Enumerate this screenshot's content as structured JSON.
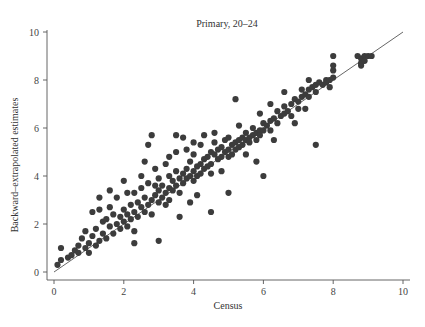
{
  "chart_data": {
    "type": "scatter",
    "title": "Primary, 20–24",
    "xlabel": "Census",
    "ylabel": "Backward–extrapolated estimates",
    "xlim": [
      0,
      10
    ],
    "ylim": [
      0,
      10
    ],
    "xticks": [
      "0",
      "2",
      "4",
      "6",
      "8",
      "10"
    ],
    "yticks": [
      "0",
      "2",
      "4",
      "6",
      "8",
      "10"
    ],
    "grid": false,
    "legend": null,
    "reference_line": {
      "type": "45-degree",
      "from": [
        0,
        0
      ],
      "to": [
        10,
        10
      ]
    },
    "marker_color": "#3c3c3c",
    "line_color": "#555555",
    "points": [
      [
        0.1,
        0.3
      ],
      [
        0.2,
        0.5
      ],
      [
        0.2,
        1.0
      ],
      [
        0.4,
        0.6
      ],
      [
        0.5,
        0.7
      ],
      [
        0.6,
        0.9
      ],
      [
        0.7,
        0.8
      ],
      [
        0.7,
        1.1
      ],
      [
        0.8,
        1.4
      ],
      [
        0.9,
        1.0
      ],
      [
        1.0,
        1.2
      ],
      [
        1.0,
        0.8
      ],
      [
        1.1,
        1.5
      ],
      [
        1.2,
        1.1
      ],
      [
        1.2,
        1.8
      ],
      [
        1.3,
        1.3
      ],
      [
        1.3,
        2.6
      ],
      [
        1.4,
        1.6
      ],
      [
        1.4,
        2.1
      ],
      [
        1.5,
        1.4
      ],
      [
        1.5,
        2.2
      ],
      [
        1.6,
        1.9
      ],
      [
        1.6,
        2.7
      ],
      [
        1.7,
        1.6
      ],
      [
        1.7,
        2.4
      ],
      [
        1.8,
        2.0
      ],
      [
        1.8,
        3.1
      ],
      [
        1.9,
        2.3
      ],
      [
        1.9,
        1.8
      ],
      [
        2.0,
        2.1
      ],
      [
        2.0,
        2.6
      ],
      [
        2.0,
        3.8
      ],
      [
        2.1,
        2.4
      ],
      [
        2.1,
        1.9
      ],
      [
        2.2,
        2.8
      ],
      [
        2.2,
        2.2
      ],
      [
        2.3,
        2.5
      ],
      [
        2.3,
        3.3
      ],
      [
        2.3,
        1.7
      ],
      [
        2.4,
        2.9
      ],
      [
        2.4,
        2.3
      ],
      [
        2.5,
        2.7
      ],
      [
        2.5,
        3.5
      ],
      [
        2.5,
        4.0
      ],
      [
        2.6,
        2.5
      ],
      [
        2.6,
        3.1
      ],
      [
        2.7,
        2.8
      ],
      [
        2.7,
        3.7
      ],
      [
        2.8,
        3.0
      ],
      [
        2.8,
        2.4
      ],
      [
        2.9,
        3.2
      ],
      [
        2.9,
        4.3
      ],
      [
        3.0,
        3.4
      ],
      [
        3.0,
        2.9
      ],
      [
        3.0,
        3.9
      ],
      [
        3.1,
        3.1
      ],
      [
        3.1,
        3.6
      ],
      [
        3.2,
        3.3
      ],
      [
        3.2,
        4.5
      ],
      [
        3.3,
        3.5
      ],
      [
        3.3,
        3.0
      ],
      [
        3.3,
        4.0
      ],
      [
        3.4,
        3.8
      ],
      [
        3.4,
        3.4
      ],
      [
        3.5,
        3.6
      ],
      [
        3.5,
        4.2
      ],
      [
        3.5,
        5.0
      ],
      [
        3.6,
        3.9
      ],
      [
        3.6,
        3.3
      ],
      [
        3.7,
        4.1
      ],
      [
        3.7,
        3.7
      ],
      [
        3.8,
        4.3
      ],
      [
        3.8,
        3.9
      ],
      [
        3.8,
        5.1
      ],
      [
        3.9,
        4.0
      ],
      [
        3.9,
        4.6
      ],
      [
        4.0,
        4.2
      ],
      [
        4.0,
        3.8
      ],
      [
        4.0,
        4.9
      ],
      [
        4.1,
        4.4
      ],
      [
        4.1,
        4.0
      ],
      [
        4.2,
        4.5
      ],
      [
        4.2,
        4.1
      ],
      [
        4.2,
        5.3
      ],
      [
        4.3,
        4.7
      ],
      [
        4.3,
        4.3
      ],
      [
        4.4,
        4.8
      ],
      [
        4.4,
        4.4
      ],
      [
        4.5,
        5.0
      ],
      [
        4.5,
        4.5
      ],
      [
        4.5,
        4.1
      ],
      [
        4.6,
        4.9
      ],
      [
        4.6,
        5.4
      ],
      [
        4.7,
        4.7
      ],
      [
        4.7,
        5.1
      ],
      [
        4.8,
        5.2
      ],
      [
        4.8,
        4.8
      ],
      [
        4.9,
        5.0
      ],
      [
        4.9,
        5.5
      ],
      [
        5.0,
        5.1
      ],
      [
        5.0,
        4.8
      ],
      [
        5.0,
        5.6
      ],
      [
        5.1,
        5.3
      ],
      [
        5.1,
        4.9
      ],
      [
        5.2,
        5.4
      ],
      [
        5.2,
        5.1
      ],
      [
        5.3,
        5.5
      ],
      [
        5.3,
        5.2
      ],
      [
        5.4,
        5.6
      ],
      [
        5.4,
        5.3
      ],
      [
        5.5,
        5.5
      ],
      [
        5.5,
        5.8
      ],
      [
        5.6,
        5.6
      ],
      [
        5.6,
        5.4
      ],
      [
        5.7,
        5.7
      ],
      [
        5.7,
        6.0
      ],
      [
        5.8,
        5.8
      ],
      [
        5.8,
        5.5
      ],
      [
        5.9,
        5.9
      ],
      [
        5.9,
        5.7
      ],
      [
        6.0,
        5.9
      ],
      [
        6.0,
        6.2
      ],
      [
        6.1,
        6.1
      ],
      [
        6.2,
        6.3
      ],
      [
        6.2,
        5.9
      ],
      [
        6.3,
        6.4
      ],
      [
        6.4,
        6.2
      ],
      [
        6.4,
        6.7
      ],
      [
        6.5,
        6.5
      ],
      [
        6.6,
        6.6
      ],
      [
        6.6,
        6.9
      ],
      [
        6.7,
        6.7
      ],
      [
        6.8,
        7.0
      ],
      [
        6.8,
        6.5
      ],
      [
        6.9,
        7.2
      ],
      [
        7.0,
        7.1
      ],
      [
        7.0,
        6.8
      ],
      [
        7.1,
        7.3
      ],
      [
        7.1,
        7.6
      ],
      [
        7.2,
        7.4
      ],
      [
        7.3,
        7.6
      ],
      [
        7.3,
        7.3
      ],
      [
        7.4,
        7.7
      ],
      [
        7.5,
        7.8
      ],
      [
        7.5,
        7.5
      ],
      [
        7.6,
        7.9
      ],
      [
        7.7,
        7.8
      ],
      [
        7.8,
        8.0
      ],
      [
        7.8,
        7.9
      ],
      [
        7.9,
        8.0
      ],
      [
        7.9,
        7.7
      ],
      [
        8.0,
        8.1
      ],
      [
        8.0,
        9.0
      ],
      [
        8.0,
        8.4
      ],
      [
        8.0,
        8.6
      ],
      [
        8.7,
        9.0
      ],
      [
        8.8,
        8.9
      ],
      [
        8.8,
        8.6
      ],
      [
        8.9,
        9.0
      ],
      [
        9.0,
        9.0
      ],
      [
        9.1,
        9.0
      ],
      [
        8.8,
        8.7
      ],
      [
        8.9,
        8.8
      ],
      [
        2.8,
        5.7
      ],
      [
        2.7,
        5.3
      ],
      [
        3.7,
        5.6
      ],
      [
        4.3,
        5.7
      ],
      [
        5.2,
        7.2
      ],
      [
        4.5,
        2.5
      ],
      [
        3.0,
        1.3
      ],
      [
        5.0,
        3.3
      ],
      [
        5.8,
        4.6
      ],
      [
        6.0,
        4.0
      ],
      [
        7.5,
        5.3
      ],
      [
        2.3,
        1.2
      ],
      [
        1.1,
        2.5
      ],
      [
        0.9,
        1.7
      ],
      [
        1.3,
        3.1
      ],
      [
        3.6,
        2.3
      ],
      [
        4.1,
        3.2
      ],
      [
        3.2,
        2.8
      ],
      [
        2.1,
        3.3
      ],
      [
        1.6,
        3.4
      ],
      [
        3.9,
        2.9
      ],
      [
        6.3,
        5.5
      ],
      [
        6.9,
        6.2
      ],
      [
        7.2,
        6.8
      ],
      [
        5.5,
        4.9
      ],
      [
        4.8,
        4.2
      ],
      [
        2.6,
        4.6
      ],
      [
        3.5,
        5.7
      ],
      [
        6.6,
        7.5
      ],
      [
        5.9,
        6.6
      ],
      [
        5.3,
        6.1
      ],
      [
        4.6,
        5.8
      ],
      [
        4.0,
        5.4
      ],
      [
        3.3,
        4.8
      ],
      [
        2.9,
        3.6
      ],
      [
        6.2,
        7.0
      ],
      [
        7.3,
        8.0
      ]
    ]
  },
  "figure": {
    "title": "Primary, 20–24",
    "xlabel": "Census",
    "ylabel": "Backward–extrapolated estimates"
  }
}
